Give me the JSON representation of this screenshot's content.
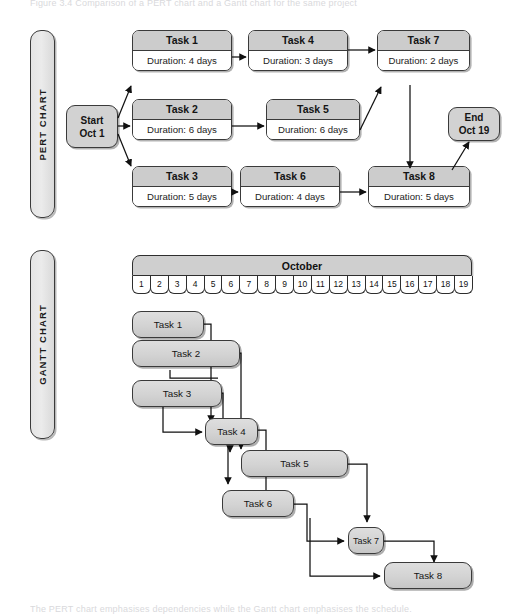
{
  "page": {
    "ghost_top": "Figure 3.4  Comparison of a PERT chart and a Gantt chart for the same project",
    "ghost_bottom": "The PERT chart emphasises dependencies while the Gantt chart emphasises the schedule."
  },
  "sections": {
    "pert": {
      "label": "PERT CHART"
    },
    "gantt": {
      "label": "GANTT CHART"
    }
  },
  "pert": {
    "start": {
      "line1": "Start",
      "line2": "Oct 1"
    },
    "end": {
      "line1": "End",
      "line2": "Oct 19"
    },
    "duration_prefix": "Duration:",
    "nodes": [
      {
        "id": "t1",
        "title": "Task 1",
        "duration": "Duration: 4 days",
        "days": 4
      },
      {
        "id": "t2",
        "title": "Task 2",
        "duration": "Duration: 6 days",
        "days": 6
      },
      {
        "id": "t3",
        "title": "Task 3",
        "duration": "Duration: 5 days",
        "days": 5
      },
      {
        "id": "t4",
        "title": "Task 4",
        "duration": "Duration: 3 days",
        "days": 3
      },
      {
        "id": "t5",
        "title": "Task 5",
        "duration": "Duration: 6 days",
        "days": 6
      },
      {
        "id": "t6",
        "title": "Task 6",
        "duration": "Duration: 4 days",
        "days": 4
      },
      {
        "id": "t7",
        "title": "Task 7",
        "duration": "Duration: 2 days",
        "days": 2
      },
      {
        "id": "t8",
        "title": "Task 8",
        "duration": "Duration: 5 days",
        "days": 5
      }
    ]
  },
  "gantt": {
    "month": "October",
    "days": [
      "1",
      "2",
      "3",
      "4",
      "5",
      "6",
      "7",
      "8",
      "9",
      "10",
      "11",
      "12",
      "13",
      "14",
      "15",
      "16",
      "17",
      "18",
      "19"
    ],
    "bars": [
      {
        "id": "g1",
        "label": "Task 1"
      },
      {
        "id": "g2",
        "label": "Task 2"
      },
      {
        "id": "g3",
        "label": "Task 3"
      },
      {
        "id": "g4",
        "label": "Task 4"
      },
      {
        "id": "g5",
        "label": "Task 5"
      },
      {
        "id": "g6",
        "label": "Task 6"
      },
      {
        "id": "g7",
        "label": "Task 7"
      },
      {
        "id": "g8",
        "label": "Task 8"
      }
    ]
  },
  "chart_data": {
    "type": "bar",
    "xlabel": "Day of October",
    "ylabel": "Task",
    "xlim": [
      1,
      19
    ],
    "grid": false,
    "legend": null,
    "categories": [
      "Task 1",
      "Task 2",
      "Task 3",
      "Task 4",
      "Task 5",
      "Task 6",
      "Task 7",
      "Task 8"
    ],
    "values": [
      4,
      6,
      5,
      3,
      6,
      4,
      2,
      5
    ],
    "gantt_tasks": [
      {
        "task": "Task 1",
        "start_day": 1,
        "end_day": 4,
        "duration_days": 4,
        "predecessors": [
          "Start"
        ]
      },
      {
        "task": "Task 2",
        "start_day": 1,
        "end_day": 6,
        "duration_days": 6,
        "predecessors": [
          "Start"
        ]
      },
      {
        "task": "Task 3",
        "start_day": 1,
        "end_day": 5,
        "duration_days": 5,
        "predecessors": [
          "Start"
        ]
      },
      {
        "task": "Task 4",
        "start_day": 5,
        "end_day": 7,
        "duration_days": 3,
        "predecessors": [
          "Task 1",
          "Task 3"
        ]
      },
      {
        "task": "Task 5",
        "start_day": 7,
        "end_day": 12,
        "duration_days": 6,
        "predecessors": [
          "Task 2",
          "Task 4"
        ]
      },
      {
        "task": "Task 6",
        "start_day": 6,
        "end_day": 9,
        "duration_days": 4,
        "predecessors": [
          "Task 3",
          "Task 4"
        ]
      },
      {
        "task": "Task 7",
        "start_day": 13,
        "end_day": 14,
        "duration_days": 2,
        "predecessors": [
          "Task 4",
          "Task 5",
          "Task 6"
        ]
      },
      {
        "task": "Task 8",
        "start_day": 15,
        "end_day": 19,
        "duration_days": 5,
        "predecessors": [
          "Task 6",
          "Task 7"
        ]
      }
    ],
    "pert_edges": [
      {
        "from": "Start",
        "to": "Task 1"
      },
      {
        "from": "Start",
        "to": "Task 2"
      },
      {
        "from": "Start",
        "to": "Task 3"
      },
      {
        "from": "Task 1",
        "to": "Task 4"
      },
      {
        "from": "Task 2",
        "to": "Task 5"
      },
      {
        "from": "Task 3",
        "to": "Task 6"
      },
      {
        "from": "Task 4",
        "to": "Task 7"
      },
      {
        "from": "Task 5",
        "to": "Task 7"
      },
      {
        "from": "Task 6",
        "to": "Task 8"
      },
      {
        "from": "Task 7",
        "to": "Task 8"
      },
      {
        "from": "Task 8",
        "to": "End"
      }
    ],
    "project_start": "Oct 1",
    "project_end": "Oct 19",
    "colors": {
      "node_header": "#cccccc",
      "node_body": "#ffffff",
      "bar_fill": "#d3d3d3",
      "border": "#3a3a3a",
      "connector": "#111111"
    }
  }
}
